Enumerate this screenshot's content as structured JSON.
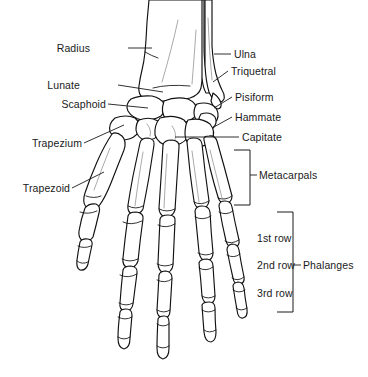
{
  "figure": {
    "background_color": "#ffffff",
    "ink_color": "#111111"
  },
  "labels_left": [
    {
      "id": "radius",
      "text": "Radius",
      "x": 90,
      "y": 42,
      "leader": "line"
    },
    {
      "id": "lunate",
      "text": "Lunate",
      "x": 80,
      "y": 79,
      "leader": "line"
    },
    {
      "id": "scaphoid",
      "text": "Scaphoid",
      "x": 56,
      "y": 98,
      "leader": "line"
    },
    {
      "id": "trapezium",
      "text": "Trapezium",
      "x": 31,
      "y": 137,
      "leader": "line"
    },
    {
      "id": "trapezoid",
      "text": "Trapezoid",
      "x": 20,
      "y": 182,
      "leader": "line"
    }
  ],
  "labels_right": [
    {
      "id": "ulna",
      "text": "Ulna",
      "x": 234,
      "y": 48,
      "leader": "line"
    },
    {
      "id": "triquetral",
      "text": "Triquetral",
      "x": 231,
      "y": 65,
      "leader": "line"
    },
    {
      "id": "pisiform",
      "text": "Pisiform",
      "x": 235,
      "y": 91,
      "leader": "line"
    },
    {
      "id": "hammate",
      "text": "Hammate",
      "x": 235,
      "y": 111,
      "leader": "line"
    },
    {
      "id": "capitate",
      "text": "Capitate",
      "x": 242,
      "y": 131,
      "leader": "line"
    }
  ],
  "brackets": [
    {
      "id": "metacarpals",
      "label": "Metacarpals",
      "label_x": 259,
      "label_y": 169,
      "spine_x": 250,
      "top_y": 150,
      "bottom_y": 205,
      "arm_length": 16
    },
    {
      "id": "phalanges",
      "label": "Phalanges",
      "label_x": 303,
      "label_y": 259,
      "spine_x": 293,
      "top_y": 212,
      "bottom_y": 312,
      "arm_length": 16
    }
  ],
  "phalange_rows": [
    {
      "id": "row-1",
      "text": "1st row",
      "x": 257,
      "y": 232
    },
    {
      "id": "row-2",
      "text": "2nd row",
      "x": 257,
      "y": 259
    },
    {
      "id": "row-3",
      "text": "3rd row",
      "x": 257,
      "y": 287
    }
  ]
}
